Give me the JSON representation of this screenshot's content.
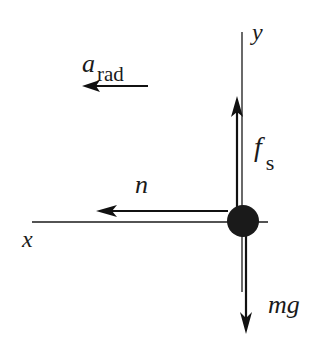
{
  "diagram": {
    "type": "free-body diagram",
    "axes": {
      "x": {
        "label": "x"
      },
      "y": {
        "label": "y"
      }
    },
    "body": {
      "shape": "filled circle",
      "color": "#1a1a1a"
    },
    "vectors": [
      {
        "id": "a_rad",
        "symbol": "a",
        "subscript": "rad",
        "direction": "left",
        "kind": "acceleration"
      },
      {
        "id": "f_s",
        "symbol": "f",
        "subscript": "s",
        "direction": "up",
        "kind": "force"
      },
      {
        "id": "n",
        "symbol": "n",
        "subscript": "",
        "direction": "left",
        "kind": "force"
      },
      {
        "id": "mg",
        "symbol": "mg",
        "subscript": "",
        "direction": "down",
        "kind": "force"
      }
    ]
  }
}
